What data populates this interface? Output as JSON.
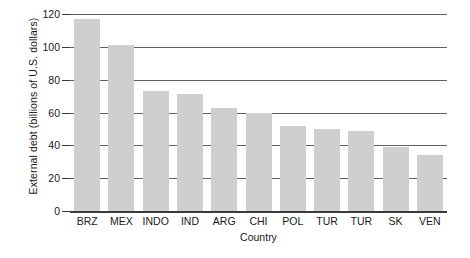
{
  "chart_data": {
    "type": "bar",
    "title": "",
    "xlabel": "Country",
    "ylabel": "External debt (billions of U.S. dollars)",
    "categories": [
      "BRZ",
      "MEX",
      "INDO",
      "IND",
      "ARG",
      "CHI",
      "POL",
      "TUR",
      "TUR",
      "SK",
      "VEN"
    ],
    "values": [
      117,
      101,
      73,
      71,
      63,
      60,
      52,
      50,
      49,
      39,
      34
    ],
    "ylim": [
      0,
      120
    ],
    "yticks": [
      0,
      20,
      40,
      60,
      80,
      100,
      120
    ],
    "ytick_labels": [
      "0",
      "20",
      "40",
      "60",
      "80",
      "100",
      "120"
    ],
    "grid": "horizontal",
    "legend": "none",
    "bar_color": "#cfcfcf",
    "axis_color": "#3a3a3a",
    "gridline_color": "#606060",
    "background_color": "#ffffff"
  }
}
